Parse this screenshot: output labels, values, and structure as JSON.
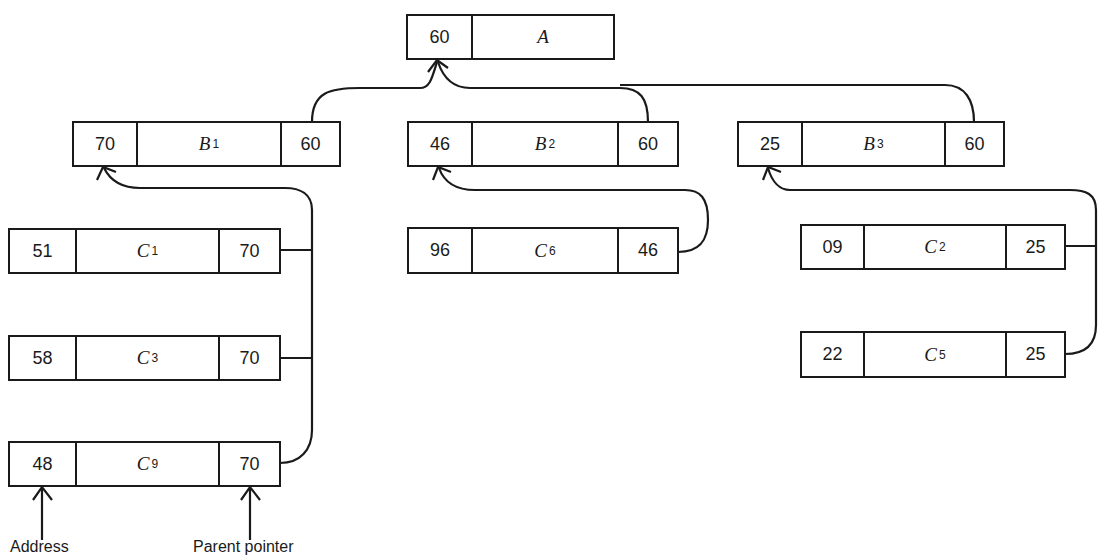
{
  "diagram": {
    "type": "tree-with-parent-pointers",
    "root": {
      "address": "60",
      "name": "A",
      "subscript": ""
    },
    "level1": [
      {
        "address": "70",
        "name": "B",
        "subscript": "1",
        "parent": "60"
      },
      {
        "address": "46",
        "name": "B",
        "subscript": "2",
        "parent": "60"
      },
      {
        "address": "25",
        "name": "B",
        "subscript": "3",
        "parent": "60"
      }
    ],
    "level2": [
      {
        "address": "51",
        "name": "C",
        "subscript": "1",
        "parent": "70"
      },
      {
        "address": "58",
        "name": "C",
        "subscript": "3",
        "parent": "70"
      },
      {
        "address": "48",
        "name": "C",
        "subscript": "9",
        "parent": "70"
      },
      {
        "address": "96",
        "name": "C",
        "subscript": "6",
        "parent": "46"
      },
      {
        "address": "09",
        "name": "C",
        "subscript": "2",
        "parent": "25"
      },
      {
        "address": "22",
        "name": "C",
        "subscript": "5",
        "parent": "25"
      }
    ],
    "annotations": {
      "address_label": "Address",
      "parent_pointer_label": "Parent pointer"
    },
    "colors": {
      "line": "#1a1a1a",
      "background": "#ffffff"
    }
  }
}
